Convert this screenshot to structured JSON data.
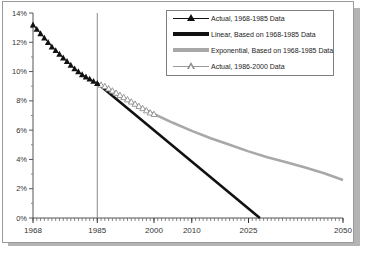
{
  "figure": {
    "background": "#ffffff",
    "border_color": "#9a9a9a",
    "shadow_color": "#b4b4b4"
  },
  "legend": {
    "position": "top-right",
    "border_color": "#808080",
    "entries": [
      {
        "label": "Actual, 1968-1985 Data",
        "key": "black-filled-triangle-line",
        "color": "#111111"
      },
      {
        "label": "Linear, Based on 1968-1985 Data",
        "key": "thick-black-line",
        "color": "#111111"
      },
      {
        "label": "Exponential, Based on 1968-1985 Data",
        "key": "thick-gray-line",
        "color": "#a8a8a8"
      },
      {
        "label": "Actual, 1986-2000 Data",
        "key": "gray-open-triangle-line",
        "color": "#8f8f8f"
      }
    ]
  },
  "axes": {
    "y_ticks": [
      "0%",
      "2%",
      "4%",
      "6%",
      "8%",
      "10%",
      "12%",
      "14%"
    ],
    "x_ticks": [
      "1968",
      "1985",
      "2000",
      "2010",
      "2025",
      "2050"
    ],
    "reference_line_year": 1985
  },
  "chart_data": {
    "type": "line",
    "title": "",
    "xlabel": "",
    "ylabel": "",
    "xlim": [
      1968,
      2050
    ],
    "ylim": [
      0,
      14
    ],
    "ytick_values": [
      0,
      2,
      4,
      6,
      8,
      10,
      12,
      14
    ],
    "ytick_labels": [
      "0%",
      "2%",
      "4%",
      "6%",
      "8%",
      "10%",
      "12%",
      "14%"
    ],
    "xtick_values": [
      1968,
      1985,
      2000,
      2010,
      2025,
      2050
    ],
    "xtick_labels": [
      "1968",
      "1985",
      "2000",
      "2010",
      "2025",
      "2050"
    ],
    "minor_xticks": "every 1 year",
    "grid": false,
    "legend_position": "upper right",
    "annotations": [
      {
        "type": "vertical-reference-line",
        "x": 1985,
        "color": "#8a8a8a"
      }
    ],
    "series": [
      {
        "name": "Actual, 1968-1985 Data",
        "marker": "filled-triangle",
        "color": "#111111",
        "x": [
          1968,
          1969,
          1970,
          1971,
          1972,
          1973,
          1974,
          1975,
          1976,
          1977,
          1978,
          1979,
          1980,
          1981,
          1982,
          1983,
          1984,
          1985
        ],
        "values": [
          13.2,
          12.9,
          12.6,
          12.3,
          12.0,
          11.7,
          11.45,
          11.2,
          10.95,
          10.7,
          10.45,
          10.2,
          10.0,
          9.8,
          9.65,
          9.5,
          9.35,
          9.2
        ]
      },
      {
        "name": "Linear, Based on 1968-1985 Data",
        "marker": "none",
        "color": "#111111",
        "linewidth": "thick",
        "x": [
          1985,
          2028
        ],
        "values": [
          9.2,
          0.0
        ]
      },
      {
        "name": "Exponential, Based on 1968-1985 Data",
        "marker": "none",
        "color": "#a8a8a8",
        "linewidth": "thick",
        "x": [
          1985,
          1990,
          1995,
          2000,
          2005,
          2010,
          2015,
          2020,
          2025,
          2030,
          2035,
          2040,
          2045,
          2050
        ],
        "values": [
          9.2,
          8.45,
          7.75,
          7.1,
          6.5,
          5.95,
          5.45,
          5.0,
          4.55,
          4.15,
          3.8,
          3.45,
          3.05,
          2.6
        ]
      },
      {
        "name": "Actual, 1986-2000 Data",
        "marker": "open-triangle",
        "color": "#8f8f8f",
        "x": [
          1986,
          1987,
          1988,
          1989,
          1990,
          1991,
          1992,
          1993,
          1994,
          1995,
          1996,
          1997,
          1998,
          1999,
          2000
        ],
        "values": [
          9.1,
          9.0,
          8.85,
          8.7,
          8.55,
          8.4,
          8.25,
          8.1,
          7.95,
          7.8,
          7.65,
          7.5,
          7.35,
          7.2,
          7.1
        ]
      }
    ]
  }
}
